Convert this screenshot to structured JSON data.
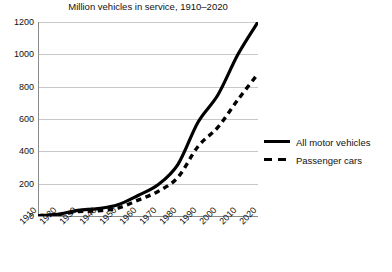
{
  "chart_data": {
    "type": "line",
    "title": "Million vehicles in service, 1910–2020",
    "xlabel": "",
    "ylabel": "",
    "grid": true,
    "legend_position": "right",
    "xlim": [
      1910,
      2020
    ],
    "ylim": [
      0,
      1200
    ],
    "x": [
      1910,
      1920,
      1930,
      1940,
      1950,
      1960,
      1970,
      1980,
      1990,
      2000,
      2010,
      2020
    ],
    "xticks": [
      "1910",
      "1920",
      "1930",
      "1940",
      "1950",
      "1960",
      "1970",
      "1980",
      "1990",
      "2000",
      "2010",
      "2020"
    ],
    "yticks": [
      "0",
      "200",
      "400",
      "600",
      "800",
      "1000",
      "1200"
    ],
    "ytick_values": [
      0,
      200,
      400,
      600,
      800,
      1000,
      1200
    ],
    "series": [
      {
        "name": "All motor vehicles",
        "style": "solid",
        "color": "#000000",
        "values": [
          2,
          11,
          35,
          46,
          70,
          127,
          193,
          320,
          580,
          750,
          1000,
          1200
        ]
      },
      {
        "name": "Passenger cars",
        "style": "dashed",
        "color": "#000000",
        "values": [
          2,
          9,
          27,
          32,
          49,
          98,
          152,
          240,
          430,
          550,
          720,
          880
        ]
      }
    ]
  },
  "legend": {
    "items": [
      {
        "label": "All motor vehicles",
        "style": "solid"
      },
      {
        "label": "Passenger cars",
        "style": "dashed"
      }
    ]
  }
}
